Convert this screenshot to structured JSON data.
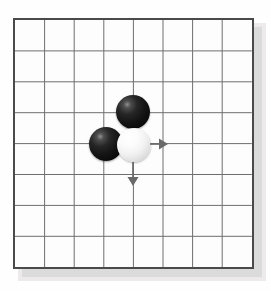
{
  "diagram": {
    "kind": "go-board-diagram",
    "board": {
      "lines_horizontal": 9,
      "lines_vertical": 9,
      "cells_horizontal": 8,
      "cells_vertical": 8,
      "origin_x": 15,
      "origin_y": 20,
      "spacing_x": 29.6,
      "spacing_y": 30.9,
      "border_color": "#4a4a4a",
      "grid_color": "#6e6e6e",
      "surface_color": "#fdfdfd",
      "shadow_color": "#d8d8d8"
    },
    "stones": [
      {
        "name": "black-stone-upper",
        "color": "black",
        "col": 4,
        "row": 3,
        "cx": 133,
        "cy": 112,
        "radius": 17,
        "fill": "#141414"
      },
      {
        "name": "black-stone-left",
        "color": "black",
        "col": 3,
        "row": 4,
        "cx": 106,
        "cy": 144,
        "radius": 17,
        "fill": "#141414"
      },
      {
        "name": "white-stone-center",
        "color": "white",
        "col": 4,
        "row": 4,
        "cx": 134,
        "cy": 145,
        "radius": 17,
        "fill": "#f4f4f4"
      }
    ],
    "arrows": [
      {
        "name": "arrow-right",
        "direction": "right",
        "from_x": 150,
        "from_y": 144,
        "to_x": 168,
        "to_y": 144,
        "color": "#6a6a6a"
      },
      {
        "name": "arrow-down",
        "direction": "down",
        "from_x": 133,
        "from_y": 162,
        "to_x": 133,
        "to_y": 186,
        "color": "#6a6a6a"
      }
    ]
  }
}
